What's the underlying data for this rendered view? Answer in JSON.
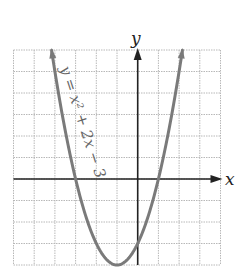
{
  "chart_data": {
    "type": "line",
    "title": "",
    "equation": "y = x^2 + 2x - 3",
    "curve_label": "y = x² + 2x − 3",
    "xlabel": "x",
    "ylabel": "y",
    "xlim": [
      -6,
      4
    ],
    "ylim": [
      -4,
      6
    ],
    "grid": true,
    "grid_step": 1,
    "series": [
      {
        "name": "y = x² + 2x − 3",
        "x": [
          -4.16,
          -4,
          -3,
          -2,
          -1,
          0,
          1,
          2,
          2.16
        ],
        "y": [
          6,
          5,
          0,
          -3,
          -4,
          -3,
          0,
          5,
          6
        ]
      }
    ],
    "key_points": {
      "vertex": [
        -1,
        -4
      ],
      "x_intercepts": [
        [
          -3,
          0
        ],
        [
          1,
          0
        ]
      ],
      "y_intercept": [
        0,
        -3
      ]
    }
  },
  "labels": {
    "x_axis": "x",
    "y_axis": "y",
    "curve": "y = x² + 2x − 3"
  },
  "colors": {
    "curve": "#7a7a7a",
    "axes": "#222222",
    "grid": "#b8b8b8"
  }
}
